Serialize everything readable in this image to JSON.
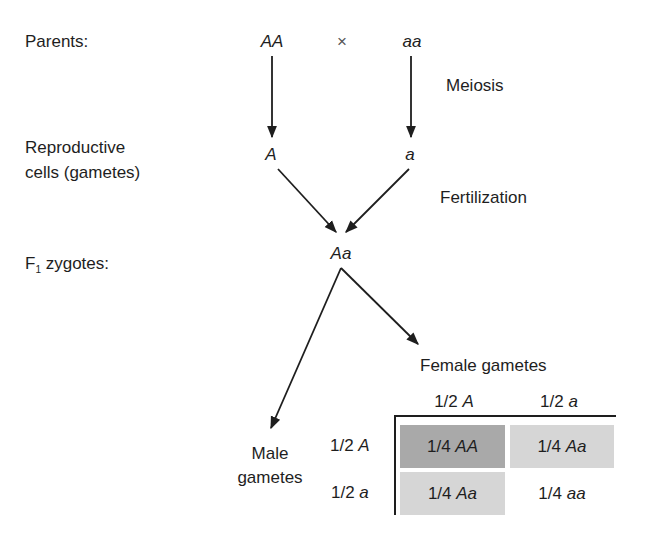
{
  "row_labels": {
    "parents": "Parents:",
    "gametes_line1": "Reproductive",
    "gametes_line2": "cells (gametes)",
    "f1_prefix": "F",
    "f1_sub": "1",
    "f1_suffix": " zygotes:"
  },
  "parents": {
    "left": "AA",
    "cross": "×",
    "right": "aa"
  },
  "gametes": {
    "left": "A",
    "right": "a"
  },
  "processes": {
    "meiosis": "Meiosis",
    "fertilization": "Fertilization"
  },
  "f1": {
    "genotype": "Aa"
  },
  "punnett": {
    "female_title": "Female gametes",
    "male_title_line1": "Male",
    "male_title_line2": "gametes",
    "col_headers": [
      {
        "frac": "1/2 ",
        "allele": "A"
      },
      {
        "frac": "1/2 ",
        "allele": "a"
      }
    ],
    "row_headers": [
      {
        "frac": "1/2 ",
        "allele": "A"
      },
      {
        "frac": "1/2 ",
        "allele": "a"
      }
    ],
    "cells": [
      [
        {
          "frac": "1/4 ",
          "geno": "AA",
          "shade": "#a9a9a9"
        },
        {
          "frac": "1/4 ",
          "geno": "Aa",
          "shade": "#d6d6d6"
        }
      ],
      [
        {
          "frac": "1/4 ",
          "geno": "Aa",
          "shade": "#d6d6d6"
        },
        {
          "frac": "1/4 ",
          "geno": "aa",
          "shade": "#ffffff"
        }
      ]
    ]
  }
}
